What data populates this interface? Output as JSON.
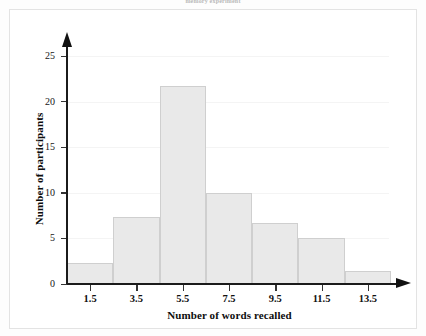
{
  "caption": "memory experiment",
  "colors": {
    "bar_fill": "#e9e9e9",
    "bar_border": "#cfcfcf",
    "axis": "#111111",
    "grid": "#f4f4f4",
    "panel_background": "#ffffff",
    "page_background": "#fdfdfd",
    "text": "#111111"
  },
  "chart_data": {
    "type": "bar",
    "title": "memory experiment",
    "xlabel": "Number of words recalled",
    "ylabel": "Number of participants",
    "categories": [
      "1.5",
      "3.5",
      "5.5",
      "7.5",
      "9.5",
      "11.5",
      "13.5"
    ],
    "values": [
      2.3,
      7.4,
      21.7,
      10,
      6.7,
      5,
      1.4
    ],
    "bin_width": 2,
    "bin_edges": [
      0.5,
      2.5,
      4.5,
      6.5,
      8.5,
      10.5,
      12.5,
      14.5
    ],
    "xlim": [
      0.5,
      14.5
    ],
    "ylim": [
      0,
      26
    ],
    "ytick_values": [
      0,
      5,
      10,
      15,
      20,
      25
    ],
    "ytick_labels": [
      "0",
      "5",
      "10",
      "15",
      "20",
      "25"
    ],
    "xtick_values": [
      1.5,
      3.5,
      5.5,
      7.5,
      9.5,
      11.5,
      13.5
    ],
    "xtick_labels": [
      "1.5",
      "3.5",
      "5.5",
      "7.5",
      "9.5",
      "11.5",
      "13.5"
    ],
    "grid": "horizontal-faint",
    "legend": "none",
    "axis_arrows": true
  }
}
